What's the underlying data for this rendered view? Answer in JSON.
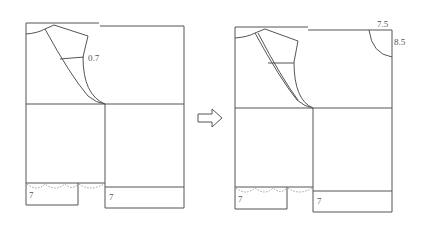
{
  "diagram": {
    "type": "garment-pattern-transformation",
    "arrow_icon": "right-arrow-outline",
    "left_figure": {
      "labels": {
        "collar_offset": "0.7",
        "left_hem_depth": "7",
        "right_hem_depth": "7"
      }
    },
    "right_figure": {
      "labels": {
        "corner_width": "7.5",
        "corner_height": "8.5",
        "left_hem_depth": "7",
        "right_hem_depth": "7"
      }
    },
    "colors": {
      "line": "#555555",
      "dashed": "#888888",
      "background": "#ffffff"
    }
  }
}
